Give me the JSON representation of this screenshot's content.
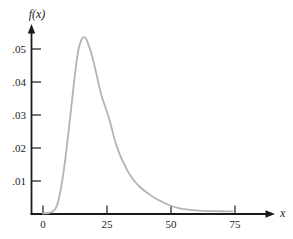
{
  "figure": {
    "background": "#ffffff",
    "axis_color": "#1a1a1a",
    "tick_label_color": "#1a1a1a"
  },
  "chart_data": {
    "type": "line",
    "title": "",
    "xlabel": "x",
    "ylabel": "f(x)",
    "xlim": [
      0,
      90
    ],
    "ylim": [
      0,
      0.057
    ],
    "grid": false,
    "legend": false,
    "x_axis_ticks": [
      {
        "value": 0,
        "label": "0"
      },
      {
        "value": 25,
        "label": "25"
      },
      {
        "value": 50,
        "label": "50"
      },
      {
        "value": 75,
        "label": "75"
      }
    ],
    "y_axis_ticks": [
      {
        "value": 0.01,
        "label": ".01"
      },
      {
        "value": 0.02,
        "label": ".02"
      },
      {
        "value": 0.03,
        "label": ".03"
      },
      {
        "value": 0.04,
        "label": ".04"
      },
      {
        "value": 0.05,
        "label": ".05"
      }
    ],
    "series": [
      {
        "name": "density-curve",
        "color": "#b3b3b3",
        "points": [
          [
            0,
            0.0002
          ],
          [
            2,
            0.0003
          ],
          [
            3,
            0.0005
          ],
          [
            4,
            0.0009
          ],
          [
            5,
            0.0018
          ],
          [
            6,
            0.004
          ],
          [
            7,
            0.0078
          ],
          [
            8,
            0.0125
          ],
          [
            9,
            0.0185
          ],
          [
            10,
            0.025
          ],
          [
            11,
            0.032
          ],
          [
            12,
            0.039
          ],
          [
            13,
            0.0455
          ],
          [
            14,
            0.0503
          ],
          [
            15,
            0.0528
          ],
          [
            16,
            0.0537
          ],
          [
            17,
            0.0528
          ],
          [
            18,
            0.0508
          ],
          [
            19,
            0.0483
          ],
          [
            20,
            0.0453
          ],
          [
            21,
            0.042
          ],
          [
            22,
            0.0385
          ],
          [
            23,
            0.0355
          ],
          [
            24,
            0.0332
          ],
          [
            26,
            0.0285
          ],
          [
            28,
            0.0225
          ],
          [
            30,
            0.018
          ],
          [
            32,
            0.0147
          ],
          [
            34,
            0.0118
          ],
          [
            36,
            0.0097
          ],
          [
            38,
            0.0081
          ],
          [
            40,
            0.0068
          ],
          [
            42,
            0.0057
          ],
          [
            44,
            0.0047
          ],
          [
            46,
            0.0039
          ],
          [
            48,
            0.0031
          ],
          [
            50,
            0.0025
          ],
          [
            53,
            0.0018
          ],
          [
            56,
            0.0014
          ],
          [
            60,
            0.0011
          ],
          [
            64,
            0.0009
          ],
          [
            68,
            0.00085
          ],
          [
            72,
            0.0008
          ],
          [
            74,
            0.0008
          ]
        ]
      }
    ]
  }
}
